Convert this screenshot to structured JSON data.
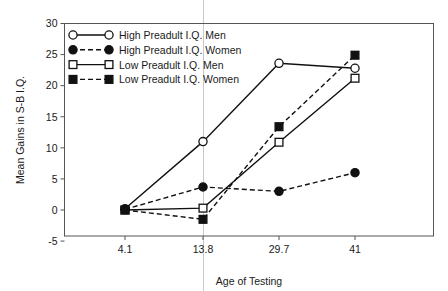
{
  "chart_data": {
    "type": "line",
    "title": "",
    "xlabel": "Age of Testing",
    "ylabel": "Mean Gains in S-B I.Q.",
    "categories": [
      "4.1",
      "13.8",
      "29.7",
      "41"
    ],
    "x_tick_labels": [
      "4.1",
      "13.8",
      "29.7",
      "41"
    ],
    "y_tick_labels": [
      "-5",
      "0",
      "5",
      "10",
      "15",
      "20",
      "25",
      "30"
    ],
    "y_ticks": [
      -5,
      0,
      5,
      10,
      15,
      20,
      25,
      30
    ],
    "ylim": [
      -5,
      30
    ],
    "grid": false,
    "legend_position": "top-left",
    "series": [
      {
        "name": "High Preadult I.Q. Men",
        "values": [
          0.2,
          11.0,
          23.6,
          22.8
        ],
        "marker": "circle-open",
        "linestyle": "solid",
        "color": "#111111"
      },
      {
        "name": "High Preadult I.Q. Women",
        "values": [
          0.1,
          3.7,
          3.0,
          6.0
        ],
        "marker": "circle-filled",
        "linestyle": "dashed",
        "color": "#111111"
      },
      {
        "name": "Low Preadult I.Q. Men",
        "values": [
          0.0,
          0.3,
          10.9,
          21.2
        ],
        "marker": "square-open",
        "linestyle": "solid",
        "color": "#111111"
      },
      {
        "name": "Low Preadult I.Q. Women",
        "values": [
          0.0,
          -1.5,
          13.4,
          24.9
        ],
        "marker": "square-filled",
        "linestyle": "dashed",
        "color": "#111111"
      }
    ]
  },
  "legend": {
    "entries": [
      "High Preadult I.Q. Men",
      "High Preadult I.Q. Women",
      "Low Preadult I.Q. Men",
      "Low Preadult I.Q. Women"
    ]
  },
  "axes": {
    "x_title": "Age of Testing",
    "y_title": "Mean Gains in S-B I.Q."
  },
  "colors": {
    "ink": "#111111",
    "frame": "#555555",
    "background": "#ffffff",
    "scanline": "#c8c8cc"
  }
}
